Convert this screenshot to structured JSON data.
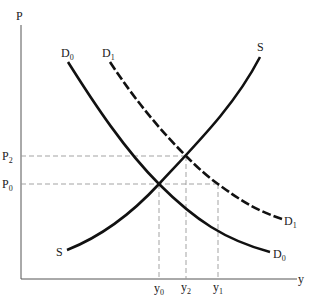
{
  "diagram": {
    "axes": {
      "y_label": "P",
      "x_label": "y"
    },
    "price_labels": [
      {
        "base": "P",
        "sub": "2"
      },
      {
        "base": "P",
        "sub": "0"
      }
    ],
    "quantity_labels": [
      {
        "base": "y",
        "sub": "0"
      },
      {
        "base": "y",
        "sub": "2"
      },
      {
        "base": "y",
        "sub": "1"
      }
    ],
    "curves": {
      "supply": {
        "label_top": "S",
        "label_bottom": "S",
        "style": "solid"
      },
      "demand_0": {
        "base": "D",
        "sub": "0",
        "style": "solid"
      },
      "demand_1": {
        "base": "D",
        "sub": "1",
        "style": "dashed"
      }
    },
    "colors": {
      "curve": "#111111",
      "axis": "#555555",
      "guide": "#999999"
    }
  }
}
